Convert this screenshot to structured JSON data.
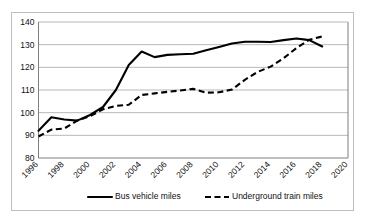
{
  "chart_data": {
    "type": "line",
    "title": "",
    "xlabel": "",
    "ylabel": "",
    "xlim": [
      1996,
      2020
    ],
    "ylim": [
      80,
      140
    ],
    "ytick_step": 10,
    "xtick_step": 2,
    "grid": true,
    "legend_position": "bottom",
    "xticks": [
      "1996",
      "1998",
      "2000",
      "2002",
      "2004",
      "2006",
      "2008",
      "2010",
      "2012",
      "2014",
      "2016",
      "2018",
      "2020"
    ],
    "yticks": [
      "80",
      "90",
      "100",
      "110",
      "120",
      "130",
      "140"
    ],
    "x": [
      1996,
      1997,
      1998,
      1999,
      2000,
      2001,
      2002,
      2003,
      2004,
      2005,
      2006,
      2007,
      2008,
      2009,
      2010,
      2011,
      2012,
      2013,
      2014,
      2015,
      2016,
      2017,
      2018
    ],
    "series": [
      {
        "name": "Bus vehicle miles",
        "style": "solid",
        "color": "#000000",
        "values": [
          92.0,
          98.0,
          97.0,
          96.5,
          99.0,
          102.5,
          110.0,
          121.0,
          127.0,
          124.5,
          125.5,
          125.8,
          126.0,
          127.5,
          129.0,
          130.5,
          131.3,
          131.3,
          131.2,
          132.0,
          132.7,
          132.0,
          129.2
        ]
      },
      {
        "name": "Underground train miles",
        "style": "dashed",
        "color": "#000000",
        "values": [
          89.5,
          92.5,
          93.0,
          96.5,
          98.5,
          101.5,
          103.0,
          103.5,
          107.8,
          108.5,
          109.2,
          109.8,
          110.5,
          108.8,
          109.0,
          110.2,
          114.5,
          118.0,
          120.3,
          124.0,
          128.5,
          132.2,
          133.6
        ]
      }
    ],
    "legend": [
      {
        "label": "Bus vehicle miles",
        "style": "solid"
      },
      {
        "label": "Underground train miles",
        "style": "dashed"
      }
    ]
  }
}
